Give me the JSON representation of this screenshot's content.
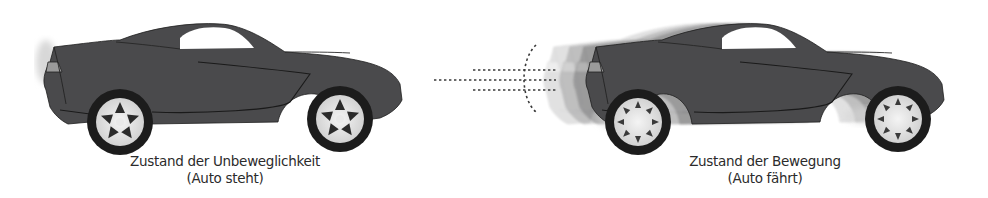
{
  "figure": {
    "panels": [
      {
        "id": "stationary",
        "caption_line1": "Zustand der Unbeweglichkeit",
        "caption_line2": "(Auto steht)",
        "object": "sports-car",
        "motion_blur": false
      },
      {
        "id": "moving",
        "caption_line1": "Zustand der Bewegung",
        "caption_line2": "(Auto fährt)",
        "object": "sports-car",
        "motion_blur": true,
        "speed_lines": 3,
        "direction": "right"
      }
    ],
    "colors": {
      "car_body": "#4a4a4c",
      "car_outline": "#1e1e1e",
      "window": "#ffffff",
      "wheel_tire": "#1c1c1c",
      "wheel_rim": "#e6e6e6",
      "ghost": "#bdbdbd",
      "speed_lines": "#3a3a3a",
      "text": "#2b2b2b"
    }
  }
}
